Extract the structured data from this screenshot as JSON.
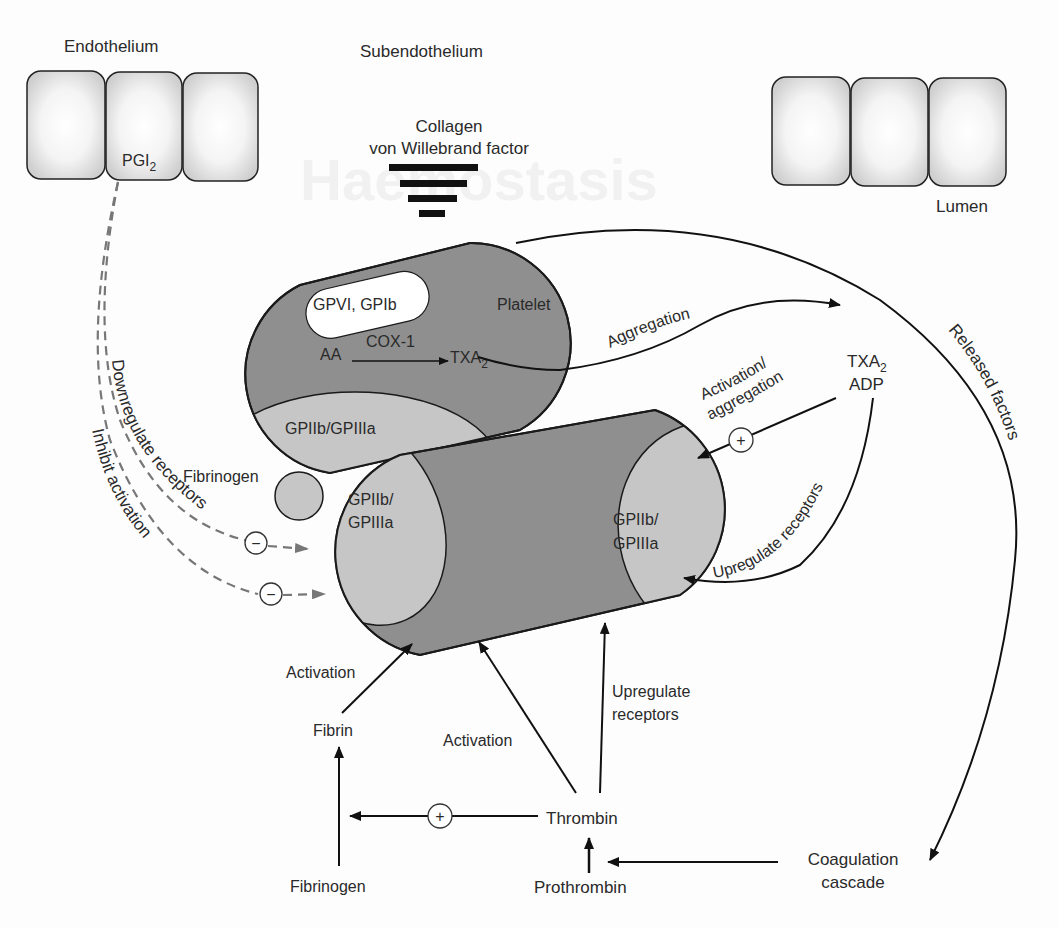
{
  "diagram": {
    "watermark": "Haemostasis",
    "colors": {
      "platelet_fill": "#8f8f8f",
      "receptor_fill": "#c6c6c6",
      "gpvi_fill": "#ffffff",
      "outline": "#1a1a1a",
      "inhibit_dash": "#777777",
      "cell_fill": "#e2e2e2"
    },
    "regions": {
      "endothelium": "Endothelium",
      "subendothelium": "Subendothelium",
      "lumen": "Lumen"
    },
    "endothelium_cells": {
      "left_count": 3,
      "right_count": 3,
      "pgi2_main": "PGI",
      "pgi2_sub": "2"
    },
    "subendothelium_label": {
      "line1": "Collagen",
      "line2": "von Willebrand factor"
    },
    "platelet_top": {
      "label": "Platelet",
      "receptor_top": "GPVI, GPIb",
      "aa": "AA",
      "enzyme": "COX-1",
      "product_main": "TXA",
      "product_sub": "2",
      "receptor_bottom": "GPIIb/GPIIIa"
    },
    "platelet_bottom": {
      "receptor_left_line1": "GPIIb/",
      "receptor_left_line2": "GPIIIa",
      "receptor_right_line1": "GPIIb/",
      "receptor_right_line2": "GPIIIa"
    },
    "fibrinogen_bridge": "Fibrinogen",
    "mediators": {
      "txa2_main": "TXA",
      "txa2_sub": "2",
      "adp": "ADP"
    },
    "arrows": {
      "aggregation": "Aggregation",
      "activation_aggregation_line1": "Activation/",
      "activation_aggregation_line2": "aggregation",
      "upregulate_receptors_right": "Upregulate receptors",
      "released_factors": "Released factors",
      "downregulate_receptors": "Downregulate receptors",
      "inhibit_activation": "Inhibit activation",
      "activation_fibrin": "Activation",
      "activation_thrombin": "Activation",
      "upregulate_receptors_line1": "Upregulate",
      "upregulate_receptors_line2": "receptors"
    },
    "signs": {
      "plus": "+",
      "minus": "−"
    },
    "cascade": {
      "fibrin": "Fibrin",
      "fibrinogen": "Fibrinogen",
      "thrombin": "Thrombin",
      "prothrombin": "Prothrombin",
      "coagulation_line1": "Coagulation",
      "coagulation_line2": "cascade"
    }
  }
}
